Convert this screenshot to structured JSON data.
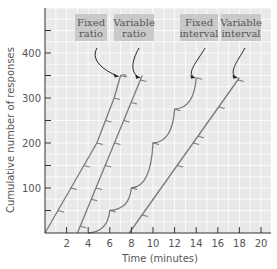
{
  "chart_data": {
    "type": "line",
    "title": "",
    "xlabel": "Time (minutes)",
    "ylabel": "Cumulative number of responses",
    "xlim": [
      0,
      21
    ],
    "ylim": [
      0,
      500
    ],
    "x_ticks": [
      2,
      4,
      6,
      8,
      10,
      12,
      14,
      16,
      18,
      20
    ],
    "y_ticks": [
      100,
      200,
      300,
      400
    ],
    "y_minor_ticks": [
      50,
      150,
      250,
      350,
      450
    ],
    "grid": true,
    "legend_position": "none (labels in boxes at top with arrows)",
    "colors": {
      "plot_bg": "#e9e9e9",
      "grid": "#ffffff",
      "curve": "#7a7a7a",
      "axis": "#333333",
      "label_box": "#c9c9c9",
      "arrow": "#222222"
    },
    "series": [
      {
        "name": "Fixed ratio",
        "label_lines": [
          "Fixed",
          "ratio"
        ],
        "description": "Steep steady responding with brief post-reinforcement pauses (steps)",
        "points": [
          [
            0,
            0
          ],
          [
            1.2,
            50
          ],
          [
            2.4,
            100
          ],
          [
            3.6,
            150
          ],
          [
            4.8,
            200
          ],
          [
            5.6,
            250
          ],
          [
            6.4,
            300
          ],
          [
            7.0,
            350
          ]
        ],
        "reinforcement_marks_y": [
          50,
          100,
          150,
          200,
          250,
          300,
          350
        ]
      },
      {
        "name": "Variable ratio",
        "label_lines": [
          "Variable",
          "ratio"
        ],
        "description": "High steady rate without pauses",
        "points": [
          [
            3.0,
            0
          ],
          [
            9.0,
            350
          ]
        ],
        "reinforcement_marks_y": [
          15,
          75,
          100,
          150,
          200,
          250,
          290,
          340
        ]
      },
      {
        "name": "Fixed interval",
        "label_lines": [
          "Fixed",
          "interval"
        ],
        "description": "Scalloped pattern: pause after reinforcement, accelerating response",
        "points": [
          [
            4.0,
            0
          ],
          [
            6.0,
            50
          ],
          [
            8.0,
            100
          ],
          [
            10.0,
            200
          ],
          [
            12.0,
            275
          ],
          [
            14.0,
            345
          ]
        ],
        "reinforcement_marks_y": [
          50,
          100,
          200,
          275,
          345
        ]
      },
      {
        "name": "Variable interval",
        "label_lines": [
          "Variable",
          "interval"
        ],
        "description": "Moderate steady rate",
        "points": [
          [
            7.8,
            0
          ],
          [
            18.0,
            345
          ]
        ],
        "reinforcement_marks_y": [
          40,
          150,
          200,
          215,
          280,
          340
        ]
      }
    ]
  }
}
